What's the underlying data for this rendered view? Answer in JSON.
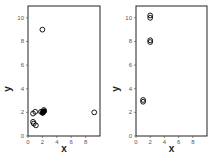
{
  "chart_data": [
    {
      "type": "scatter",
      "title": "",
      "xlabel": "x",
      "ylabel": "y",
      "xlim": [
        0,
        10
      ],
      "ylim": [
        0,
        11
      ],
      "xticks": [
        0,
        2,
        4,
        6,
        8
      ],
      "yticks": [
        0,
        2,
        4,
        6,
        8,
        10
      ],
      "grid": false,
      "marker": "open-circle",
      "color": "#000000",
      "points": [
        {
          "x": 2.0,
          "y": 9.0
        },
        {
          "x": 0.7,
          "y": 1.9
        },
        {
          "x": 1.0,
          "y": 2.05
        },
        {
          "x": 1.8,
          "y": 2.05
        },
        {
          "x": 2.0,
          "y": 2.0
        },
        {
          "x": 2.2,
          "y": 2.2
        },
        {
          "x": 2.05,
          "y": 1.95,
          "filled": true
        },
        {
          "x": 2.25,
          "y": 2.1,
          "filled": true
        },
        {
          "x": 0.7,
          "y": 1.2
        },
        {
          "x": 0.8,
          "y": 1.05
        },
        {
          "x": 1.1,
          "y": 0.9
        },
        {
          "x": 9.2,
          "y": 2.0
        }
      ]
    },
    {
      "type": "scatter",
      "title": "",
      "xlabel": "x",
      "ylabel": "y",
      "xlim": [
        0,
        10
      ],
      "ylim": [
        0,
        11
      ],
      "xticks": [
        0,
        2,
        4,
        6,
        8
      ],
      "yticks": [
        0,
        2,
        4,
        6,
        8,
        10
      ],
      "grid": false,
      "marker": "open-circle",
      "color": "#000000",
      "points": [
        {
          "x": 2.0,
          "y": 10.2
        },
        {
          "x": 2.0,
          "y": 10.0
        },
        {
          "x": 2.0,
          "y": 8.1
        },
        {
          "x": 2.0,
          "y": 7.95
        },
        {
          "x": 1.0,
          "y": 3.05
        },
        {
          "x": 1.0,
          "y": 2.9
        }
      ]
    }
  ]
}
